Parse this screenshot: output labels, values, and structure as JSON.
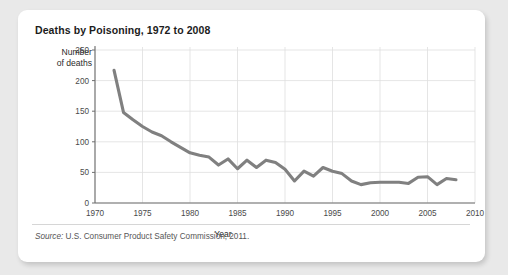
{
  "card": {
    "title": "Deaths by Poisoning, 1972 to 2008",
    "source_label": "Source:",
    "source_text": " U.S. Consumer Product Safety Commission, 2011."
  },
  "chart_data": {
    "type": "line",
    "title": "Deaths by Poisoning, 1972 to 2008",
    "xlabel": "Year",
    "ylabel": "Number of deaths",
    "ylabel_line1": "Number",
    "ylabel_line2": "of deaths",
    "xlim": [
      1970,
      2010
    ],
    "ylim": [
      0,
      250
    ],
    "xticks": [
      1970,
      1975,
      1980,
      1985,
      1990,
      1995,
      2000,
      2005,
      2010
    ],
    "yticks": [
      0,
      50,
      100,
      150,
      200,
      250
    ],
    "grid": true,
    "legend": "none",
    "line_color": "#808080",
    "x": [
      1972,
      1973,
      1974,
      1975,
      1976,
      1977,
      1978,
      1979,
      1980,
      1981,
      1982,
      1983,
      1984,
      1985,
      1986,
      1987,
      1988,
      1989,
      1990,
      1991,
      1992,
      1993,
      1994,
      1995,
      1996,
      1997,
      1998,
      1999,
      2000,
      2001,
      2002,
      2003,
      2004,
      2005,
      2006,
      2007,
      2008
    ],
    "values": [
      217,
      148,
      136,
      125,
      116,
      110,
      100,
      91,
      82,
      78,
      75,
      62,
      72,
      56,
      70,
      58,
      70,
      66,
      55,
      36,
      52,
      44,
      58,
      52,
      48,
      36,
      30,
      33,
      34,
      34,
      34,
      32,
      42,
      43,
      30,
      40,
      38
    ],
    "series": [
      {
        "name": "Deaths by poisoning",
        "values": [
          217,
          148,
          136,
          125,
          116,
          110,
          100,
          91,
          82,
          78,
          75,
          62,
          72,
          56,
          70,
          58,
          70,
          66,
          55,
          36,
          52,
          44,
          58,
          52,
          48,
          36,
          30,
          33,
          34,
          34,
          34,
          32,
          42,
          43,
          30,
          40,
          38
        ]
      }
    ]
  }
}
